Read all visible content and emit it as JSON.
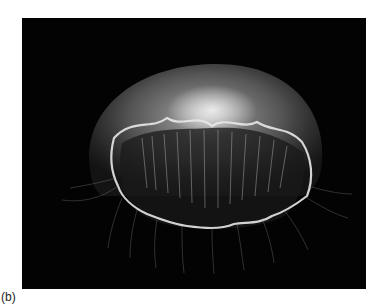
{
  "figure": {
    "caption_label": "(b)",
    "image_subject": "moon jellyfish (Aurelia) photographed against a black background",
    "background_color": "#030303",
    "subject_color": "#e6e6e6"
  }
}
